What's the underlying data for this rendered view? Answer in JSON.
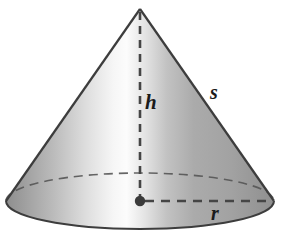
{
  "figure": {
    "name": "cone-geometry-diagram",
    "shape": "cone",
    "background_color": "#ffffff",
    "labels": {
      "height": "h",
      "slant": "s",
      "radius": "r"
    },
    "geometry": {
      "apex": {
        "x": 140,
        "y": 9
      },
      "base_center": {
        "x": 140,
        "y": 201
      },
      "base_semi_major_x": 134,
      "base_semi_minor_y": 28,
      "height_px": 192,
      "radius_px": 134
    },
    "colors": {
      "outline": "#3d3d3d",
      "dash": "#4a4a4a",
      "surface_dark": "#8d8d8d",
      "surface_mid": "#b3b3b3",
      "surface_highlight": "#fbfbfb",
      "surface_right": "#a6a6a6",
      "base_shadow": "#9a9a9a",
      "label_color": "#1a1a1a",
      "center_dot": "#3a3a3a"
    },
    "elements": {
      "apex_point": "apex-point",
      "height_line": "height-dashed-line",
      "radius_line": "radius-dashed-line",
      "slant_edge": "slant-edge-right",
      "back_arc": "base-back-dashed-arc",
      "front_arc": "base-front-solid-arc",
      "center_dot": "base-center-dot"
    }
  }
}
